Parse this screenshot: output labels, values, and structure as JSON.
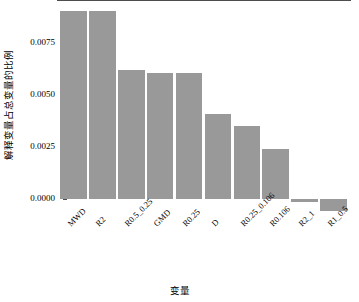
{
  "chart_data": {
    "type": "bar",
    "title": "",
    "xlabel": "变量",
    "ylabel": "解释变量占总变量的比例",
    "categories": [
      "MWD",
      "R2",
      "R0.5_0.25",
      "GMD",
      "R0.25",
      "D",
      "R0.25_0.106",
      "R0.106",
      "R2_1",
      "R1_0.5"
    ],
    "values": [
      0.00905,
      0.00905,
      0.0062,
      0.00605,
      0.00605,
      0.0041,
      0.00352,
      0.00242,
      -0.00014,
      -0.00058
    ],
    "ytick_labels": [
      "0.0075",
      "0.0050",
      "0.0025",
      "0.0000"
    ],
    "ytick_values": [
      0.0075,
      0.005,
      0.0025,
      0.0
    ],
    "ylim": [
      -0.00075,
      0.00945
    ],
    "grid": false,
    "legend": null,
    "bar_color": "#999999",
    "axis_color": "#4d4d4d",
    "background": "#ffffff"
  }
}
